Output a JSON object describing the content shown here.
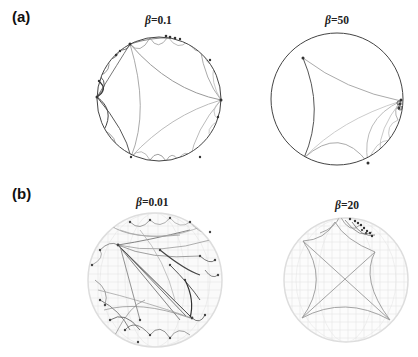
{
  "figure": {
    "panels": [
      {
        "label": "(a)",
        "subplots": [
          {
            "beta_symbol": "β",
            "beta_value": "=0.1",
            "type": "Poincaré disk"
          },
          {
            "beta_symbol": "β",
            "beta_value": "=50",
            "type": "Poincaré disk"
          }
        ]
      },
      {
        "label": "(b)",
        "subplots": [
          {
            "beta_symbol": "β",
            "beta_value": "=0.01",
            "type": "sphere mesh"
          },
          {
            "beta_symbol": "β",
            "beta_value": "=20",
            "type": "sphere mesh"
          }
        ]
      }
    ],
    "colors": {
      "dark_edge": "#333333",
      "mid_edge": "#888888",
      "light_edge": "#bbbbbb",
      "mesh": "#d8d8d8",
      "node": "#333333"
    }
  }
}
